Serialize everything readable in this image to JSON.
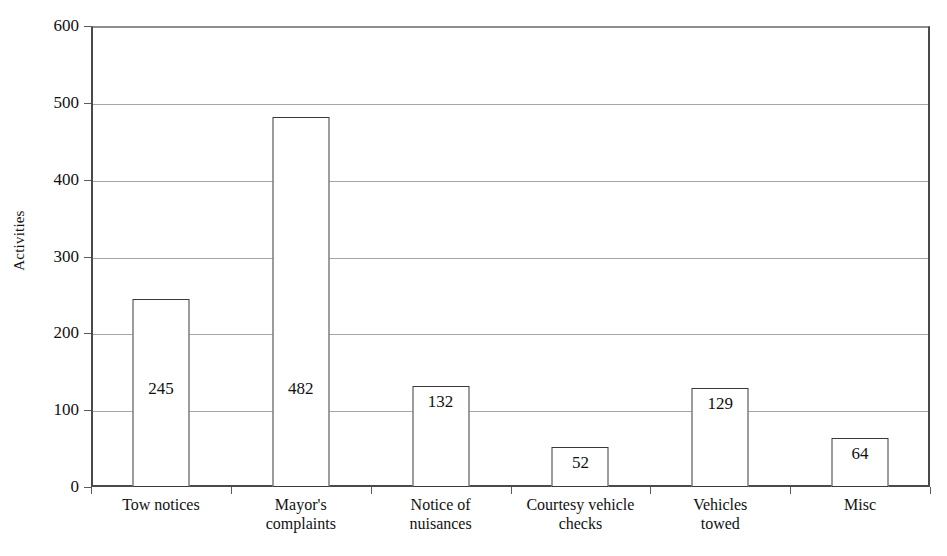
{
  "chart_data": {
    "type": "bar",
    "title": "",
    "subtitle": "",
    "xlabel": "",
    "ylabel": "Activities",
    "ylim": [
      0,
      600
    ],
    "ytick_step": 100,
    "yticks": [
      "0",
      "100",
      "200",
      "300",
      "400",
      "500",
      "600"
    ],
    "grid": "horizontal",
    "legend": "none",
    "bar_fill_color": "#ffffff",
    "bar_border_color": "#3a3a3a",
    "gridline_color": "#a6a6a6",
    "axis_color": "#4a4a4a",
    "data_labels_inside_bars": true,
    "categories": [
      "Tow notices",
      "Mayor's complaints",
      "Notice of nuisances",
      "Courtesy vehicle checks",
      "Vehicles towed",
      "Misc"
    ],
    "category_lines": [
      [
        "Tow notices"
      ],
      [
        "Mayor's",
        "complaints"
      ],
      [
        "Notice of",
        "nuisances"
      ],
      [
        "Courtesy vehicle",
        "checks"
      ],
      [
        "Vehicles",
        "towed"
      ],
      [
        "Misc"
      ]
    ],
    "values": [
      245,
      482,
      132,
      52,
      129,
      64
    ],
    "value_labels": [
      "245",
      "482",
      "132",
      "52",
      "129",
      "64"
    ],
    "series": [
      {
        "name": "Activities",
        "values": [
          245,
          482,
          132,
          52,
          129,
          64
        ]
      }
    ]
  }
}
